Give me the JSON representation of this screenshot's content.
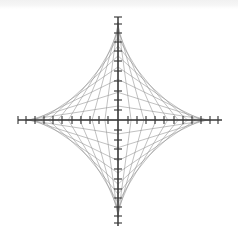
{
  "page": {
    "width": 238,
    "height": 244,
    "background_color": "#ffffff",
    "ghost_caption": ""
  },
  "figure": {
    "title": "",
    "caption": ""
  },
  "chart_data": {
    "type": "line",
    "title": "",
    "subtitle": "",
    "xlabel": "",
    "ylabel": "",
    "legend": [],
    "grid": false,
    "curve_name": "astroid",
    "curve_equation": "x^(2/3) + y^(2/3) = a^(2/3)",
    "construction": "envelope-of-sliding-segments",
    "center_px": [
      118,
      120
    ],
    "semi_axis_x_px": 92,
    "semi_axis_y_px": 98,
    "axes": {
      "x_axis": {
        "start_px": [
          18,
          120
        ],
        "end_px": [
          222,
          120
        ],
        "color": "#3a3a3a",
        "stroke_width": 1.5,
        "tick_half_length_px": 4,
        "tick_count_per_side": 11,
        "tick_positions_px": [
          -100,
          -92,
          -83,
          -74,
          -65,
          -56,
          -46,
          -37,
          -28,
          -19,
          -10,
          10,
          19,
          28,
          37,
          46,
          56,
          65,
          74,
          83,
          92,
          100
        ],
        "tick_labels": []
      },
      "y_axis": {
        "start_px": [
          118,
          17
        ],
        "end_px": [
          118,
          226
        ],
        "color": "#3a3a3a",
        "stroke_width": 1.5,
        "tick_half_length_px": 4,
        "tick_count_per_side": 11,
        "tick_positions_px": [
          -103,
          -96,
          -87,
          -78,
          -69,
          -59,
          -49,
          -39,
          -29,
          -20,
          -10,
          10,
          20,
          29,
          39,
          49,
          59,
          69,
          78,
          87,
          96,
          103
        ],
        "tick_labels": []
      }
    },
    "envelope": {
      "segment_count_per_quadrant": 11,
      "quadrants": 4,
      "total_segments": 44,
      "segment_length_px": 96,
      "line_color": "#8e8e8e",
      "line_width": 0.55,
      "parameter_t_values": [
        0.0,
        0.1,
        0.2,
        0.3,
        0.4,
        0.5,
        0.6,
        0.7,
        0.8,
        0.9,
        1.0
      ]
    },
    "cusps_px": [
      [
        118,
        22
      ],
      [
        210,
        120
      ],
      [
        118,
        218
      ],
      [
        26,
        120
      ]
    ]
  }
}
